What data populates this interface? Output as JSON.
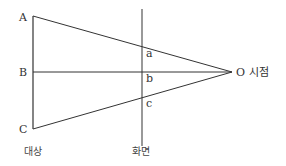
{
  "diagram": {
    "points": {
      "A": "A",
      "B": "B",
      "C": "C",
      "a": "a",
      "b": "b",
      "c": "c",
      "O": "O 시점"
    },
    "labels": {
      "object": "대상",
      "screen": "화면"
    },
    "colors": {
      "line": "#333333",
      "background": "#ffffff"
    }
  }
}
